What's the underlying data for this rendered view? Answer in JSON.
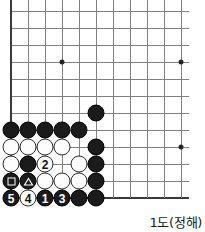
{
  "diagram": {
    "kind": "go-board-problem",
    "caption": "1도(정해)",
    "geometry": {
      "origin_x": 11,
      "origin_y": 11,
      "cell": 17,
      "cols": 11,
      "rows": 11,
      "left_edge_col": 1,
      "bottom_edge_row": 11
    },
    "hoshi": [
      {
        "col": 4,
        "row": 4
      },
      {
        "col": 11,
        "row": 4
      },
      {
        "col": 11,
        "row": 9
      }
    ],
    "stones": [
      {
        "col": 6,
        "row": 7,
        "color": "black",
        "label": "",
        "mark": ""
      },
      {
        "col": 1,
        "row": 8,
        "color": "black",
        "label": "",
        "mark": ""
      },
      {
        "col": 2,
        "row": 8,
        "color": "black",
        "label": "",
        "mark": ""
      },
      {
        "col": 3,
        "row": 8,
        "color": "black",
        "label": "",
        "mark": ""
      },
      {
        "col": 4,
        "row": 8,
        "color": "black",
        "label": "",
        "mark": ""
      },
      {
        "col": 5,
        "row": 8,
        "color": "black",
        "label": "",
        "mark": ""
      },
      {
        "col": 1,
        "row": 9,
        "color": "white",
        "label": "",
        "mark": ""
      },
      {
        "col": 2,
        "row": 9,
        "color": "white",
        "label": "",
        "mark": ""
      },
      {
        "col": 3,
        "row": 9,
        "color": "white",
        "label": "",
        "mark": ""
      },
      {
        "col": 4,
        "row": 9,
        "color": "white",
        "label": "",
        "mark": ""
      },
      {
        "col": 6,
        "row": 9,
        "color": "black",
        "label": "",
        "mark": ""
      },
      {
        "col": 1,
        "row": 10,
        "color": "white",
        "label": "",
        "mark": ""
      },
      {
        "col": 2,
        "row": 10,
        "color": "black",
        "label": "",
        "mark": ""
      },
      {
        "col": 3,
        "row": 10,
        "color": "white",
        "label": "2",
        "mark": ""
      },
      {
        "col": 5,
        "row": 10,
        "color": "white",
        "label": "",
        "mark": ""
      },
      {
        "col": 6,
        "row": 10,
        "color": "black",
        "label": "",
        "mark": ""
      },
      {
        "col": 1,
        "row": 11,
        "color": "black",
        "label": "",
        "mark": "square"
      },
      {
        "col": 2,
        "row": 11,
        "color": "black",
        "label": "",
        "mark": "triangle"
      },
      {
        "col": 3,
        "row": 11,
        "color": "white",
        "label": "",
        "mark": ""
      },
      {
        "col": 4,
        "row": 11,
        "color": "white",
        "label": "",
        "mark": ""
      },
      {
        "col": 5,
        "row": 11,
        "color": "white",
        "label": "",
        "mark": ""
      },
      {
        "col": 6,
        "row": 11,
        "color": "black",
        "label": "",
        "mark": ""
      },
      {
        "col": 1,
        "row": 12,
        "color": "black",
        "label": "5",
        "mark": ""
      },
      {
        "col": 2,
        "row": 12,
        "color": "white",
        "label": "4",
        "mark": ""
      },
      {
        "col": 3,
        "row": 12,
        "color": "black",
        "label": "1",
        "mark": ""
      },
      {
        "col": 4,
        "row": 12,
        "color": "black",
        "label": "3",
        "mark": ""
      },
      {
        "col": 5,
        "row": 12,
        "color": "black",
        "label": "",
        "mark": ""
      },
      {
        "col": 6,
        "row": 12,
        "color": "black",
        "label": "",
        "mark": ""
      }
    ]
  }
}
